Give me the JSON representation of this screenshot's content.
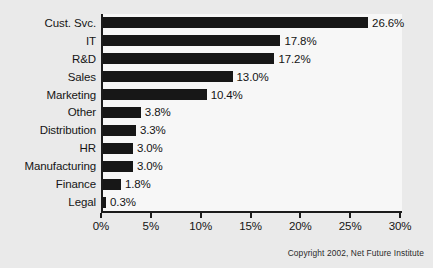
{
  "chart_data": {
    "type": "bar",
    "orientation": "horizontal",
    "title": "",
    "xlabel": "",
    "ylabel": "",
    "xlim": [
      0,
      30
    ],
    "grid": false,
    "legend": null,
    "categories": [
      "Cust. Svc.",
      "IT",
      "R&D",
      "Sales",
      "Marketing",
      "Other",
      "Distribution",
      "HR",
      "Manufacturing",
      "Finance",
      "Legal"
    ],
    "values": [
      26.6,
      17.8,
      17.2,
      13.0,
      10.4,
      3.8,
      3.3,
      3.0,
      3.0,
      1.8,
      0.3
    ],
    "value_labels": [
      "26.6%",
      "17.8%",
      "17.2%",
      "13.0%",
      "10.4%",
      "3.8%",
      "3.3%",
      "3.0%",
      "3.0%",
      "1.8%",
      "0.3%"
    ],
    "xticks": [
      0,
      5,
      10,
      15,
      20,
      25,
      30
    ],
    "xtick_labels": [
      "0%",
      "5%",
      "10%",
      "15%",
      "20%",
      "25%",
      "30%"
    ],
    "bar_color": "#171717",
    "axis_color": "#1b1b1b",
    "background_color": "#eaeaea",
    "plot_background_color": "#f7f7f7"
  },
  "footer": {
    "copyright": "Copyright 2002, Net Future Institute"
  }
}
